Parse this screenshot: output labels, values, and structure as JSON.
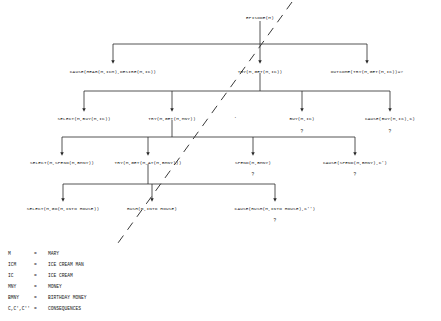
{
  "diagram": {
    "type": "tree",
    "title_node": "EPISODE(M)",
    "rows": {
      "row1": [
        {
          "id": "episode",
          "label": "EPISODE(M)",
          "x": 260,
          "y": 16,
          "qmark": ""
        }
      ],
      "row2": [
        {
          "id": "cause-hear-desire",
          "label": "CAUSE(HEAR(M,ICM),DESIRE(M,IC))",
          "x": 113,
          "y": 70,
          "qmark": ""
        },
        {
          "id": "try-get-ic",
          "label": "TRY(M,GET(M,IC))",
          "x": 260,
          "y": 70,
          "qmark": ""
        },
        {
          "id": "outcome-try-get-ic",
          "label": "OUTCOME(TRY(M,GET(M,IC))=?",
          "x": 367,
          "y": 70,
          "qmark": ""
        }
      ],
      "row3": [
        {
          "id": "select-buy-ic",
          "label": "SELECT(M,BUY(M,IC))",
          "x": 84,
          "y": 117,
          "qmark": ""
        },
        {
          "id": "try-get-mny",
          "label": "TRY(M,GET(M,MNY))",
          "x": 172,
          "y": 117,
          "qmark": ""
        },
        {
          "id": "buy-m-ic",
          "label": "BUY(M,IC)",
          "x": 302,
          "y": 117,
          "qmark": "?"
        },
        {
          "id": "cause-buy-c",
          "label": "CAUSE(BUY(M,IC),C)",
          "x": 390,
          "y": 117,
          "qmark": "?"
        }
      ],
      "row4": [
        {
          "id": "select-spend-bmny",
          "label": "SELECT(M,SPEND(M,BMNY))",
          "x": 62,
          "y": 161,
          "qmark": ""
        },
        {
          "id": "try-get-at-bmny",
          "label": "TRY(M,GET(M,AT(M,BMNY)))",
          "x": 148,
          "y": 161,
          "qmark": ""
        },
        {
          "id": "spend-m-bmny",
          "label": "SPEND(M,BMNY)",
          "x": 253,
          "y": 161,
          "qmark": "?"
        },
        {
          "id": "cause-spend-bmny-c1",
          "label": "CAUSE(SPEND(M,BMNY),C')",
          "x": 355,
          "y": 161,
          "qmark": "?"
        }
      ],
      "row5": [
        {
          "id": "select-go-into-house",
          "label": "SELECT(M,GO(M,INTO HOUSE))",
          "x": 63,
          "y": 207,
          "qmark": ""
        },
        {
          "id": "rush-into-house",
          "label": "RUSH(M,INTO HOUSE)",
          "x": 152,
          "y": 207,
          "qmark": ""
        },
        {
          "id": "cause-rush-into-house-c2",
          "label": "CAUSE(RUSH(M,INTO HOUSE),C'')",
          "x": 275,
          "y": 207,
          "qmark": "?"
        }
      ]
    },
    "divider": {
      "name": "dashed-diagonal-divider",
      "style": "dashed",
      "x1": 292,
      "y1": 2,
      "x2": 118,
      "y2": 243
    },
    "separator_dot": {
      "label": "·",
      "x": 235,
      "y": 113
    }
  },
  "legend": {
    "title": "",
    "items": [
      {
        "symbol": "M",
        "eq": "=",
        "definition": "MARY"
      },
      {
        "symbol": "ICM",
        "eq": "=",
        "definition": "ICE CREAM MAN"
      },
      {
        "symbol": "IC",
        "eq": "=",
        "definition": "ICE CREAM"
      },
      {
        "symbol": "MNY",
        "eq": "=",
        "definition": "MONEY"
      },
      {
        "symbol": "BMNY",
        "eq": "=",
        "definition": "BIRTHDAY MONEY"
      },
      {
        "symbol": "C,C',C''",
        "eq": "=",
        "definition": "CONSEQUENCES"
      }
    ]
  },
  "colors": {
    "background": "#ffffff",
    "ink": "#151515",
    "line": "#2a2a2a"
  }
}
